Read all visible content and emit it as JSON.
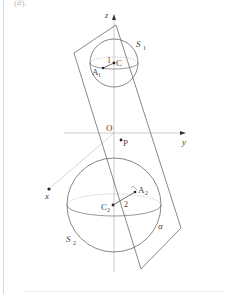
{
  "caption": "(#).",
  "diagram": {
    "type": "3d-geometry",
    "axes": {
      "x_label": "x",
      "y_label": "y",
      "z_label": "z",
      "origin_label": "O"
    },
    "points": {
      "P": "P",
      "C1": "C",
      "C1_sub": "1",
      "A1": "A",
      "A1_sub": "1",
      "C2": "C",
      "C2_sub": "2",
      "A2": "A",
      "A2_sub": "2"
    },
    "spheres": {
      "S1": "S",
      "S1_sub": "1",
      "S2": "S",
      "S2_sub": "2"
    },
    "plane_label": "α",
    "radius_small_label": "1",
    "radius_large_label": "2",
    "colors": {
      "line": "#555555",
      "axis": "#999999",
      "dotted": "#999999",
      "background": "#ffffff"
    }
  }
}
